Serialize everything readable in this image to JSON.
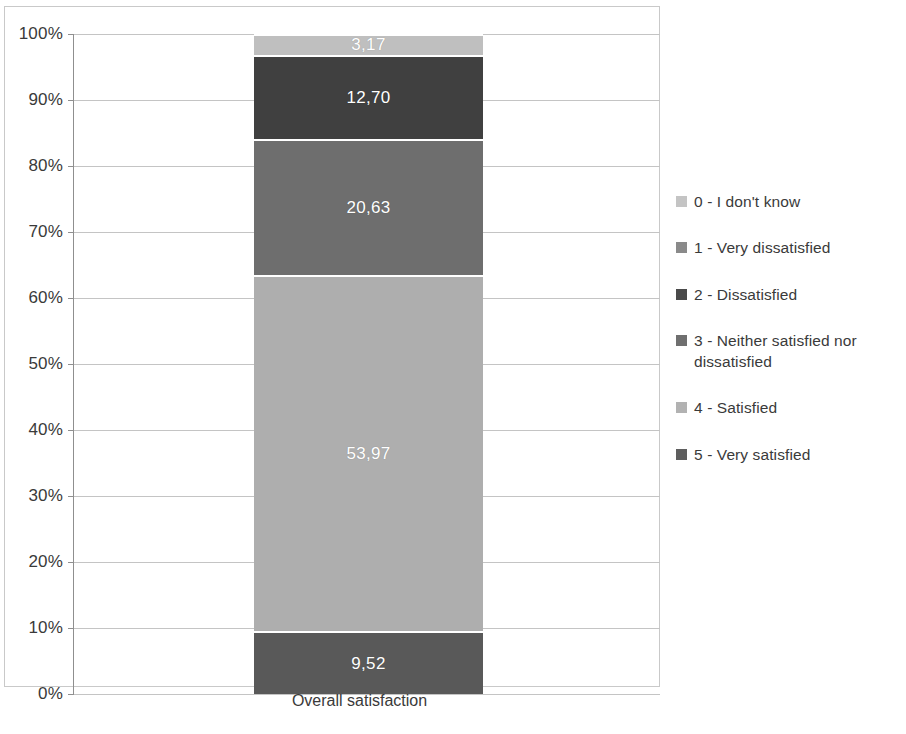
{
  "chart_data": {
    "type": "bar",
    "subtype": "100% stacked column",
    "title": "",
    "xlabel": "",
    "ylabel": "",
    "categories": [
      "Overall satisfaction"
    ],
    "ylim": [
      0,
      100
    ],
    "grid": true,
    "legend_position": "right",
    "y_tick_labels": [
      "100%",
      "90%",
      "80%",
      "70%",
      "60%",
      "50%",
      "40%",
      "30%",
      "20%",
      "10%",
      "0%"
    ],
    "y_tick_values": [
      100,
      90,
      80,
      70,
      60,
      50,
      40,
      30,
      20,
      10,
      0
    ],
    "series": [
      {
        "name": "0 - I don't know",
        "values": [
          3.17
        ],
        "label": "3,17",
        "color": "#bfbfbf",
        "stack_from": 96.83,
        "stack_to": 100.0
      },
      {
        "name": "1 - Very dissatisfied",
        "values": [
          12.7
        ],
        "label": "12,70",
        "color": "#404040",
        "stack_from": 84.13,
        "stack_to": 96.83
      },
      {
        "name": "2 - Dissatisfied",
        "values": [
          20.63
        ],
        "label": "20,63",
        "color": "#6e6e6e",
        "stack_from": 63.5,
        "stack_to": 84.13
      },
      {
        "name": "3 - Neither satisfied nor dissatisfied",
        "values": [
          0
        ],
        "label": "",
        "color": "#808080",
        "stack_from": 63.5,
        "stack_to": 63.5
      },
      {
        "name": "4 - Satisfied",
        "values": [
          53.97
        ],
        "label": "53,97",
        "color": "#aeaeae",
        "stack_from": 9.52,
        "stack_to": 63.5
      },
      {
        "name": "5 - Very satisfied",
        "values": [
          9.52
        ],
        "label": "9,52",
        "color": "#595959",
        "stack_from": 0.0,
        "stack_to": 9.52
      }
    ]
  },
  "axis": {
    "category_label": "Overall satisfaction"
  },
  "legend": {
    "items": [
      {
        "marker": "legend-swatch-0",
        "label": "0 - I don't know",
        "color": "#c4c4c4"
      },
      {
        "marker": "legend-swatch-1",
        "label": "1 - Very dissatisfied",
        "color": "#8a8a8a"
      },
      {
        "marker": "legend-swatch-2",
        "label": "2 - Dissatisfied",
        "color": "#4a4a4a"
      },
      {
        "marker": "legend-swatch-3",
        "label": "3 - Neither satisfied nor dissatisfied",
        "color": "#6f6f6f"
      },
      {
        "marker": "legend-swatch-4",
        "label": "4 - Satisfied",
        "color": "#b2b2b2"
      },
      {
        "marker": "legend-swatch-5",
        "label": "5 - Very satisfied",
        "color": "#5e5e5e"
      }
    ]
  }
}
